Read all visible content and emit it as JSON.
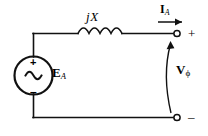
{
  "diagram": {
    "stroke_color": "#111111",
    "background_color": "#ffffff",
    "labels": {
      "reactance": {
        "text": "jX",
        "j": "j",
        "x": "X"
      },
      "current": {
        "base": "I",
        "sub": "A"
      },
      "source_emf": {
        "base": "E",
        "sub": "A"
      },
      "terminal_voltage": {
        "base": "V",
        "sub": "ϕ"
      },
      "terminal_positive": "+",
      "terminal_negative": "–",
      "source_positive": "+",
      "source_negative": "–",
      "source_waveform": "~"
    }
  }
}
